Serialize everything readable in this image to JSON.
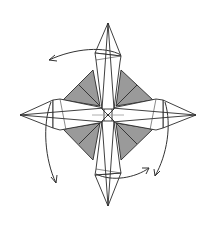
{
  "diagram": {
    "colors": {
      "paper": "#ffffff",
      "shaded_layer": "#9a9a9a",
      "line": "#2a2a2a",
      "reference_line": "#9a9a9a"
    },
    "elements": {
      "points": [
        "top",
        "right",
        "bottom",
        "left"
      ],
      "shaded_triangles": 4,
      "rotation_arrows": 4
    }
  }
}
